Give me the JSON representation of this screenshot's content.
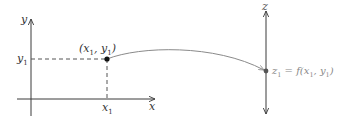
{
  "diagram": {
    "type": "function-mapping",
    "domain_plane": {
      "x_axis_label": "x",
      "y_axis_label": "y",
      "x_tick_label": "x",
      "x_tick_sub": "1",
      "y_tick_label": "y",
      "y_tick_sub": "1",
      "point_label_open": "(x",
      "point_label_sub1": "1",
      "point_label_mid": ", y",
      "point_label_sub2": "1",
      "point_label_close": ")"
    },
    "range_line": {
      "axis_label": "z",
      "value_label_z": "z",
      "value_label_z_sub": "1",
      "value_label_eq": " = f(x",
      "value_label_sub1": "1",
      "value_label_mid": ", y",
      "value_label_sub2": "1",
      "value_label_close": ")"
    },
    "colors": {
      "axis": "#3a3a3a",
      "dashed": "#555555",
      "curve": "#8a8a8a",
      "label": "#333333",
      "range_label": "#888888",
      "point": "#111111"
    }
  }
}
